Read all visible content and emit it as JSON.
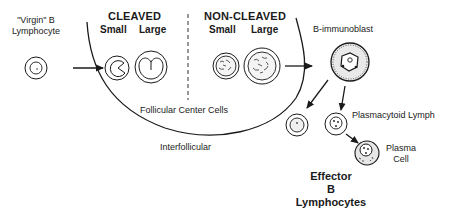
{
  "labels": {
    "virgin_b": [
      "\"Virgin\" B",
      "Lymphocyte"
    ],
    "cleaved": "CLEAVED",
    "non_cleaved": "NON-CLEAVED",
    "cleaved_small": "Small",
    "cleaved_large": "Large",
    "non_cleaved_small": "Small",
    "non_cleaved_large": "Large",
    "follicular_center": "Follicular Center Cells",
    "interfollicular": "Interfollicular",
    "b_immunoblast": "B-immunoblast",
    "plasmacytoid": "Plasmacytoid Lymph",
    "plasma_cell": [
      "Plasma",
      "Cell"
    ],
    "effector": [
      "Effector",
      "B",
      "Lymphocytes"
    ]
  },
  "colors": {
    "ink": "#1a1a1a",
    "background": "#ffffff"
  }
}
